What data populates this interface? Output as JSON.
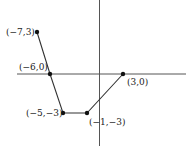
{
  "figure": {
    "type": "graph-on-axes",
    "axes": {
      "x_axis": true,
      "y_axis": true,
      "color": "#444444"
    },
    "line_color": "#333333",
    "points": [
      {
        "label": "(−7,3)",
        "x": -7,
        "y": 3
      },
      {
        "label": "(−6,0)",
        "x": -6,
        "y": 0
      },
      {
        "label": "(−5,−3)",
        "x": -5,
        "y": -3
      },
      {
        "label": "(−1,−3)",
        "x": -1,
        "y": -3
      },
      {
        "label": "(3,0)",
        "x": 3,
        "y": 0
      }
    ]
  }
}
